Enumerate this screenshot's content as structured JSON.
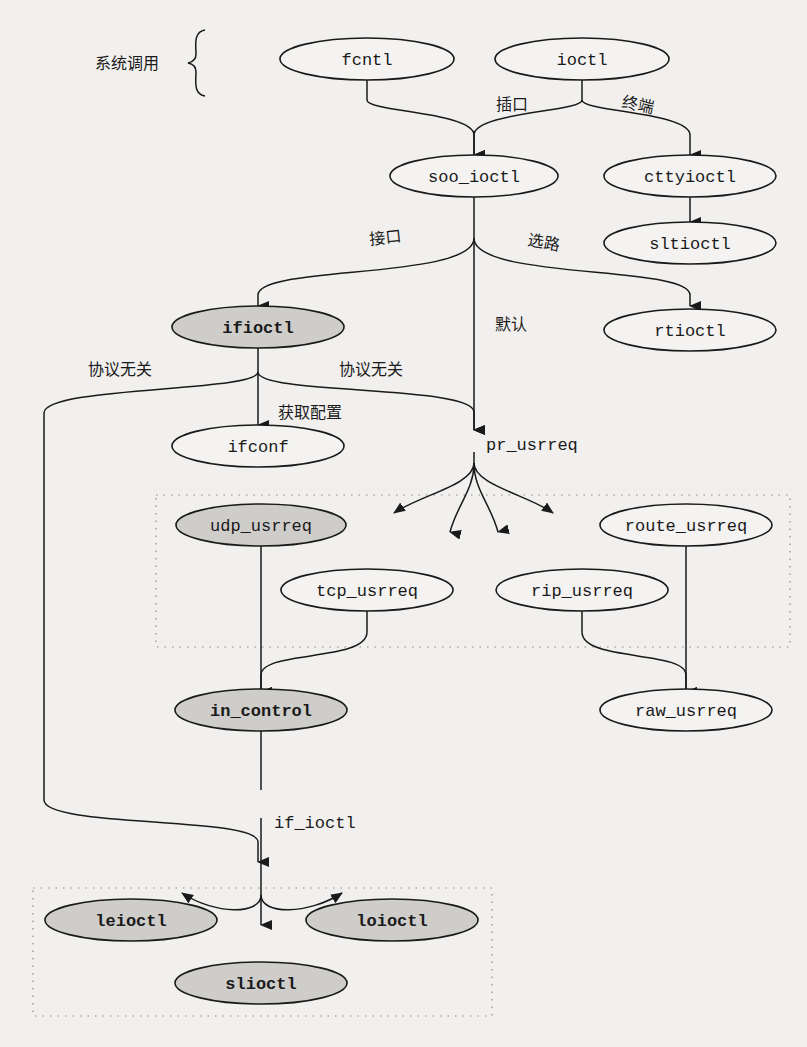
{
  "diagram": {
    "syscall_label": "系统调用",
    "nodes": {
      "fcntl": "fcntl",
      "ioctl": "ioctl",
      "soo_ioctl": "soo_ioctl",
      "cttyioctl": "cttyioctl",
      "sltioctl": "sltioctl",
      "ifioctl": "ifioctl",
      "rtioctl": "rtioctl",
      "ifconf": "ifconf",
      "pr_usrreq": "pr_usrreq",
      "udp_usrreq": "udp_usrreq",
      "tcp_usrreq": "tcp_usrreq",
      "rip_usrreq": "rip_usrreq",
      "route_usrreq": "route_usrreq",
      "in_control": "in_control",
      "raw_usrreq": "raw_usrreq",
      "if_ioctl": "if_ioctl",
      "leioctl": "leioctl",
      "loioctl": "loioctl",
      "slioctl": "slioctl"
    },
    "edge_labels": {
      "socket": "插口",
      "terminal": "终端",
      "interface": "接口",
      "routing": "选路",
      "default": "默认",
      "proto_independent_left": "协议无关",
      "proto_independent_right": "协议无关",
      "get_config": "获取配置"
    },
    "shaded_nodes": [
      "ifioctl",
      "udp_usrreq",
      "in_control",
      "leioctl",
      "loioctl",
      "slioctl"
    ],
    "colors": {
      "background": "#f1f0ee",
      "shaded_fill": "#cfcdca",
      "line": "#1a1a1a"
    }
  }
}
